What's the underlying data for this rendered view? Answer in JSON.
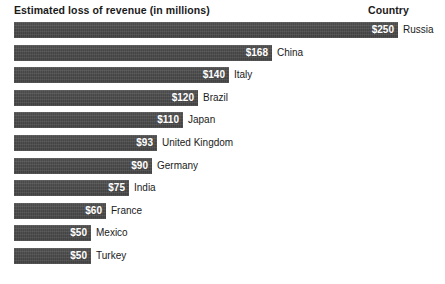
{
  "chart_data": {
    "type": "bar",
    "orientation": "horizontal",
    "title": "",
    "xlabel": "Estimated loss of revenue (in millions)",
    "ylabel": "Country",
    "value_prefix": "$",
    "grid": false,
    "legend": null,
    "xlim": [
      0,
      250
    ],
    "categories": [
      "Russia",
      "China",
      "Italy",
      "Brazil",
      "Japan",
      "United Kingdom",
      "Germany",
      "India",
      "France",
      "Mexico",
      "Turkey"
    ],
    "values": [
      250,
      168,
      140,
      120,
      110,
      93,
      90,
      75,
      60,
      50,
      50
    ],
    "value_labels": [
      "$250",
      "$168",
      "$140",
      "$120",
      "$110",
      "$93",
      "$90",
      "$75",
      "$60",
      "$50",
      "$50"
    ],
    "bar_color": "#4a4a4a",
    "value_label_color": "#ffffff",
    "category_label_color": "#1a1a1a",
    "background": "#ffffff"
  },
  "header": {
    "left_title": "Estimated loss of revenue (in millions)",
    "right_title": "Country"
  },
  "rows": [
    {
      "country": "Russia",
      "value": 250,
      "value_label": "$250"
    },
    {
      "country": "China",
      "value": 168,
      "value_label": "$168"
    },
    {
      "country": "Italy",
      "value": 140,
      "value_label": "$140"
    },
    {
      "country": "Brazil",
      "value": 120,
      "value_label": "$120"
    },
    {
      "country": "Japan",
      "value": 110,
      "value_label": "$110"
    },
    {
      "country": "United Kingdom",
      "value": 93,
      "value_label": "$93"
    },
    {
      "country": "Germany",
      "value": 90,
      "value_label": "$90"
    },
    {
      "country": "India",
      "value": 75,
      "value_label": "$75"
    },
    {
      "country": "France",
      "value": 60,
      "value_label": "$60"
    },
    {
      "country": "Mexico",
      "value": 50,
      "value_label": "$50"
    },
    {
      "country": "Turkey",
      "value": 50,
      "value_label": "$50"
    }
  ],
  "layout": {
    "bar_origin_x": 14,
    "px_per_unit": 1.536,
    "row_pitch": 22.6,
    "bar_height": 16,
    "label_gap": 5
  }
}
